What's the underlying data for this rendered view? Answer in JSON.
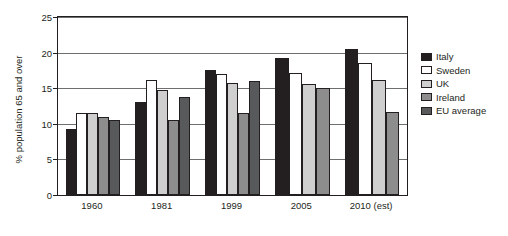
{
  "chart_data": {
    "type": "bar",
    "title": "",
    "xlabel": "",
    "ylabel": "% population 65 and over",
    "categories": [
      "1960",
      "1981",
      "1999",
      "2005",
      "2010 (est)"
    ],
    "ylim": [
      0,
      25
    ],
    "yticks": [
      0,
      5,
      10,
      15,
      20,
      25
    ],
    "ytick_labels": [
      "0",
      "5",
      "10",
      "15",
      "20",
      "25"
    ],
    "grid": true,
    "legend_position": "right",
    "series": [
      {
        "name": "Italy",
        "color": "#231f20",
        "values": [
          9.3,
          13.0,
          17.5,
          19.3,
          20.5
        ]
      },
      {
        "name": "Sweden",
        "color": "#ffffff",
        "values": [
          11.5,
          16.2,
          17.0,
          17.2,
          18.5
        ]
      },
      {
        "name": "UK",
        "color": "#cfcfcf",
        "values": [
          11.5,
          14.8,
          15.7,
          15.6,
          16.2
        ]
      },
      {
        "name": "Ireland",
        "color": "#8d8d8d",
        "values": [
          11.0,
          10.6,
          11.5,
          15.0,
          11.6
        ]
      },
      {
        "name": "EU average",
        "color": "#58595b",
        "values": [
          10.5,
          13.8,
          16.0,
          null,
          null
        ]
      }
    ]
  },
  "legend": {
    "items": [
      {
        "label": "Italy",
        "color": "#231f20"
      },
      {
        "label": "Sweden",
        "color": "#ffffff"
      },
      {
        "label": "UK",
        "color": "#cfcfcf"
      },
      {
        "label": "Ireland",
        "color": "#8d8d8d"
      },
      {
        "label": "EU average",
        "color": "#58595b"
      }
    ]
  }
}
